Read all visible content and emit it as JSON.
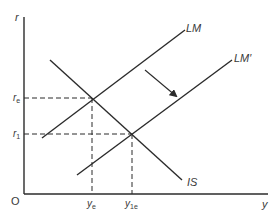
{
  "diagram": {
    "type": "IS-LM",
    "axes": {
      "y_axis_label": "r",
      "x_axis_label": "y",
      "origin_label": "O"
    },
    "curves": [
      {
        "id": "IS",
        "label": "IS",
        "slope": "downward"
      },
      {
        "id": "LM",
        "label": "LM",
        "slope": "upward"
      },
      {
        "id": "LM_prime",
        "label": "LM′",
        "slope": "upward"
      }
    ],
    "shift": {
      "from": "LM",
      "to": "LM′",
      "direction": "down-right"
    },
    "equilibria": [
      {
        "id": "e",
        "r_label": "r",
        "r_sub": "e",
        "y_label": "y",
        "y_sub": "e",
        "curves": [
          "IS",
          "LM"
        ]
      },
      {
        "id": "1",
        "r_label": "r",
        "r_sub": "1",
        "y_label": "y",
        "y_sub": "1e",
        "curves": [
          "IS",
          "LM′"
        ]
      }
    ]
  },
  "colors": {
    "line": "#2b2b2b",
    "text": "#3a3a3a",
    "background": "#ffffff"
  }
}
